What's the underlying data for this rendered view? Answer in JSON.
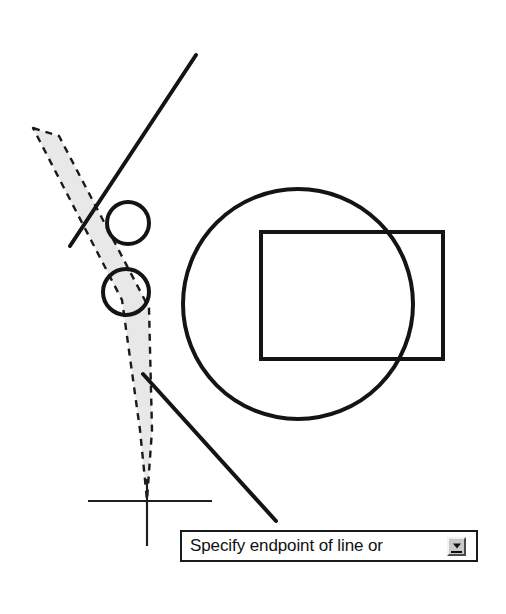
{
  "app": {
    "background_color": "#ffffff",
    "stroke_color": "#141414",
    "selection_fill_color": "#e8e8e8",
    "selection_edge_color": "#1a1a1a"
  },
  "command_prompt": {
    "text": "Specify endpoint of line or",
    "expand_button_icon": "dropdown-arrow-icon",
    "border_color": "#1a1a1a",
    "background_color": "#ffffff",
    "button_face_color": "#c8c8c8"
  },
  "cursor": {
    "type": "crosshair",
    "x": 147,
    "y": 501,
    "horizontal_span": [
      88,
      212
    ],
    "vertical_span": [
      479,
      546
    ]
  },
  "geometry": {
    "big_circle": {
      "cx": 298,
      "cy": 304,
      "r": 115,
      "stroke_width": 4
    },
    "rectangle": {
      "x": 261,
      "y": 232,
      "width": 182,
      "height": 127,
      "stroke_width": 4
    },
    "small_circle_upper": {
      "cx": 128,
      "cy": 223,
      "r": 21,
      "stroke_width": 4
    },
    "small_circle_lower": {
      "cx": 126,
      "cy": 292,
      "r": 23,
      "stroke_width": 4
    },
    "line_upper": {
      "x1": 196,
      "y1": 55,
      "x2": 70,
      "y2": 246,
      "stroke_width": 4
    },
    "line_lower": {
      "x1": 143,
      "y1": 374,
      "x2": 276,
      "y2": 521,
      "stroke_width": 4
    },
    "selection_fence": {
      "points": "33,128 59,136 149,308 152,430 147,500 140,430 122,300",
      "fill": "#e8e8e8",
      "dash": "7,6",
      "stroke_width": 2.4
    }
  }
}
